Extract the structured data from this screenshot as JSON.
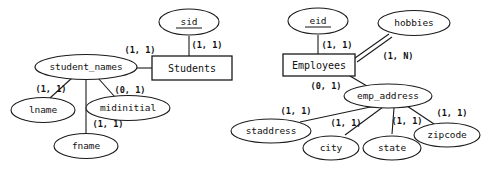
{
  "diagram": {
    "type": "er-diagram",
    "notation": "min-max cardinality",
    "colors": {
      "stroke": "#1a1a1a",
      "fill": "#ffffff",
      "text": "#111111"
    }
  },
  "students_group": {
    "entity": {
      "label": "Students",
      "shape": "rectangle"
    },
    "attributes": {
      "sid": {
        "label": "sid",
        "key": true,
        "shape": "ellipse"
      },
      "student_names": {
        "label": "student_names",
        "composite": true,
        "shape": "ellipse"
      },
      "lname": {
        "label": "lname",
        "shape": "ellipse"
      },
      "midinitial": {
        "label": "midinitial",
        "shape": "ellipse"
      },
      "fname": {
        "label": "fname",
        "shape": "ellipse"
      }
    },
    "cardinalities": {
      "sid_to_students": "(1, 1)",
      "student_names_to_students": "(1, 1)",
      "lname": "(1, 1)",
      "midinitial": "(0, 1)",
      "fname": "(1, 1)"
    }
  },
  "employees_group": {
    "entity": {
      "label": "Employees",
      "shape": "rectangle"
    },
    "attributes": {
      "eid": {
        "label": "eid",
        "key": true,
        "shape": "ellipse"
      },
      "hobbies": {
        "label": "hobbies",
        "multivalued": true,
        "shape": "ellipse"
      },
      "emp_address": {
        "label": "emp_address",
        "composite": true,
        "shape": "ellipse"
      },
      "staddress": {
        "label": "staddress",
        "shape": "ellipse"
      },
      "city": {
        "label": "city",
        "shape": "ellipse"
      },
      "state": {
        "label": "state",
        "shape": "ellipse"
      },
      "zipcode": {
        "label": "zipcode",
        "shape": "ellipse"
      }
    },
    "cardinalities": {
      "eid_to_employees": "(1, 1)",
      "hobbies_to_employees": "(1, N)",
      "emp_address_to_employees": "(0, 1)",
      "staddress": "(1, 1)",
      "city": "(1, 1)",
      "state": "(1, 1)",
      "zipcode": "(1, 1)"
    }
  }
}
